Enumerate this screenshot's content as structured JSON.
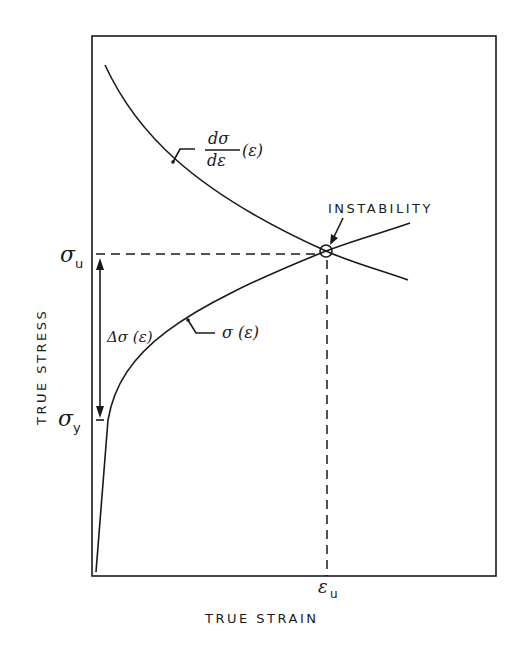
{
  "diagram": {
    "title": "",
    "x_axis_label": "TRUE STRAIN",
    "y_axis_label": "TRUE STRESS",
    "y_ticks": [
      {
        "symbol": "σ",
        "sub": "u",
        "meaning": "ultimate stress"
      },
      {
        "symbol": "σ",
        "sub": "y",
        "meaning": "yield stress"
      }
    ],
    "x_ticks": [
      {
        "symbol": "ε",
        "sub": "u",
        "meaning": "uniform strain at instability"
      }
    ],
    "curves": [
      {
        "name": "stress-strain curve",
        "label": "σ (ε)"
      },
      {
        "name": "strain hardening rate curve",
        "label_num": "dσ",
        "label_den": "dε",
        "label_arg": "(ε)"
      }
    ],
    "annotations": {
      "instability": "INSTABILITY",
      "delta_sigma": "Δσ (ε)"
    }
  }
}
